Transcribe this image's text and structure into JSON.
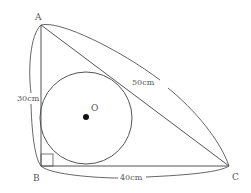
{
  "figure": {
    "vertices": {
      "A": "A",
      "B": "B",
      "C": "C"
    },
    "center_label": "O",
    "sides": {
      "AB": "30cm",
      "AC": "50cm",
      "BC": "40cm"
    },
    "colors": {
      "line": "#555555",
      "center_dot": "#111111",
      "background": "#ffffff"
    }
  }
}
